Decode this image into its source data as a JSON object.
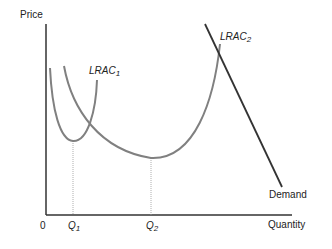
{
  "diagram": {
    "type": "economics-cost-curves",
    "axes": {
      "y_label": "Price",
      "x_label": "Quantity",
      "origin_label": "0"
    },
    "curves": [
      {
        "name": "LRAC",
        "subscript": "1",
        "color": "#808080"
      },
      {
        "name": "LRAC",
        "subscript": "2",
        "color": "#808080"
      },
      {
        "name": "Demand",
        "color": "#333333"
      }
    ],
    "x_ticks": [
      {
        "name": "Q",
        "subscript": "1"
      },
      {
        "name": "Q",
        "subscript": "2"
      }
    ],
    "colors": {
      "axis": "#333333",
      "cost_curve": "#808080",
      "demand": "#333333",
      "dotted_guide": "#999999"
    }
  }
}
